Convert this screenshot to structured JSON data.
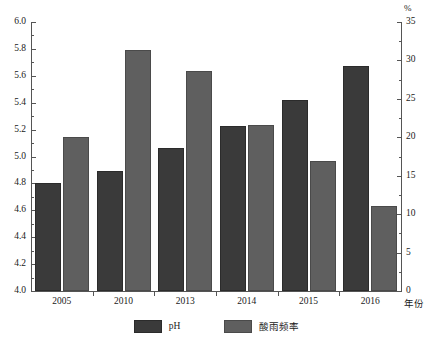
{
  "chart_data": {
    "type": "bar",
    "title": "",
    "subtitle": "",
    "xlabel": "年份",
    "ylabel": "",
    "y2label": "%",
    "grid": false,
    "legend_position": "bottom-center",
    "categories": [
      "2005",
      "2010",
      "2013",
      "2014",
      "2015",
      "2016"
    ],
    "series": [
      {
        "name": "pH",
        "axis": "left",
        "color": "#3a3a3a",
        "values": [
          4.8,
          4.89,
          5.06,
          5.23,
          5.42,
          5.67
        ]
      },
      {
        "name": "酸雨频率",
        "axis": "right",
        "color": "#5f5f5f",
        "unit": "%",
        "values": [
          20.0,
          31.4,
          28.6,
          21.6,
          16.9,
          11.0
        ]
      }
    ],
    "ylim": [
      4.0,
      6.0
    ],
    "ytick_step": 0.2,
    "yticks": [
      "6.0",
      "5.8",
      "5.6",
      "5.4",
      "5.2",
      "5.0",
      "4.8",
      "4.6",
      "4.4",
      "4.2",
      "4.0"
    ],
    "y2lim": [
      0,
      35
    ],
    "y2tick_step": 5,
    "y2ticks": [
      "35",
      "30",
      "25",
      "20",
      "15",
      "10",
      "5",
      "0"
    ],
    "y2_minor_step": 2.5
  },
  "legend": {
    "items": [
      {
        "label": "pH",
        "color": "#3a3a3a"
      },
      {
        "label": "酸雨频率",
        "color": "#5f5f5f"
      }
    ]
  },
  "axes": {
    "right_unit": "%",
    "x_axis_title": "年份"
  }
}
